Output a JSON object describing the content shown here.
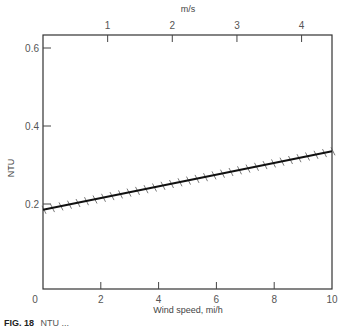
{
  "chart_data": {
    "type": "line",
    "title": "",
    "xlabel": "Wind speed, mi/h",
    "ylabel": "NTU",
    "x2label": "m/s",
    "xlim": [
      0,
      10
    ],
    "ylim": [
      0,
      0.63
    ],
    "x_ticks": [
      0,
      2,
      4,
      6,
      8,
      10
    ],
    "x_tick_labels": [
      "0",
      "2",
      "4",
      "6",
      "8",
      "10"
    ],
    "y_ticks": [
      0.2,
      0.4,
      0.6
    ],
    "y_tick_labels": [
      "0.2",
      "0.4",
      "0.6"
    ],
    "x2_ticks_ms": [
      1,
      2,
      3,
      4
    ],
    "x2_tick_labels": [
      "1",
      "2",
      "3",
      "4"
    ],
    "grid": false,
    "legend": null,
    "series": [
      {
        "name": "NTU vs wind speed",
        "style": "hatched boundary line (hatches below)",
        "x": [
          0,
          10
        ],
        "y": [
          0.185,
          0.335
        ]
      }
    ]
  },
  "caption": {
    "label": "FIG. 18",
    "text": "NTU (...) (caption truncated at image edge)"
  }
}
